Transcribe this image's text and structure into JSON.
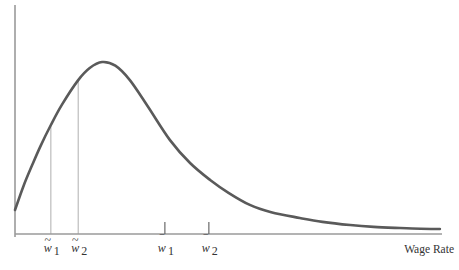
{
  "chart_data": {
    "type": "line",
    "title": "",
    "xlabel": "Wage Rate",
    "ylabel": "",
    "xlim": [
      0,
      100
    ],
    "ylim": [
      0,
      1
    ],
    "grid": false,
    "legend": "none",
    "series": [
      {
        "name": "wage distribution density",
        "color": "#5a5a5a",
        "x": [
          0,
          2,
          4,
          6,
          8.4,
          11,
          14.8,
          17.5,
          20.4,
          23.5,
          26.9,
          31,
          36.3,
          41,
          45.7,
          50,
          55,
          60,
          66.7,
          72,
          78.5,
          84,
          90.2,
          95,
          99.5
        ],
        "y": [
          0.105,
          0.21,
          0.3,
          0.385,
          0.476,
          0.565,
          0.672,
          0.725,
          0.751,
          0.735,
          0.672,
          0.56,
          0.41,
          0.31,
          0.236,
          0.18,
          0.127,
          0.095,
          0.07,
          0.053,
          0.039,
          0.031,
          0.026,
          0.023,
          0.022
        ]
      }
    ],
    "guide_lines": [
      {
        "label_base": "w",
        "accent": "tilde",
        "subscript": "1",
        "x": 8.4
      },
      {
        "label_base": "w",
        "accent": "tilde",
        "subscript": "2",
        "x": 14.8
      }
    ],
    "tick_marks": [
      {
        "label_base": "w",
        "accent": "bar",
        "subscript": "1",
        "x": 35.1
      },
      {
        "label_base": "w",
        "accent": "bar",
        "subscript": "2",
        "x": 45.4
      }
    ],
    "annotations": {
      "w_tilde_1": "w̃",
      "w_tilde_2": "w̃",
      "w_bar_1": "w̄",
      "w_bar_2": "w̄",
      "sub_1": "1",
      "sub_2": "2"
    }
  }
}
